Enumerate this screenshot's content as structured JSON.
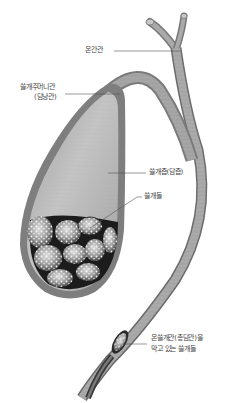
{
  "figure": {
    "colors": {
      "background": "#ffffff",
      "wall": "#8c8c8c",
      "wall_dark": "#5e5e5e",
      "bile": "#a8a8a8",
      "bile_light": "#c6c6c6",
      "stone": "#9a9a9a",
      "stone_highlight": "#f2f2f2",
      "stone_shadow": "#1e1e1e",
      "leader_line": "#555555",
      "label_text": "#444444"
    },
    "labels": {
      "common_hepatic_duct": "온간관",
      "cystic_duct_line1": "쓸개주머니관",
      "cystic_duct_line2": "(담낭관)",
      "bile": "쓸개즙(담즙)",
      "gallstones": "쓸개돌",
      "blocking_stone_line1": "온쓸개관(총담관)을",
      "blocking_stone_line2": "막고 있는 쓸개돌"
    }
  }
}
